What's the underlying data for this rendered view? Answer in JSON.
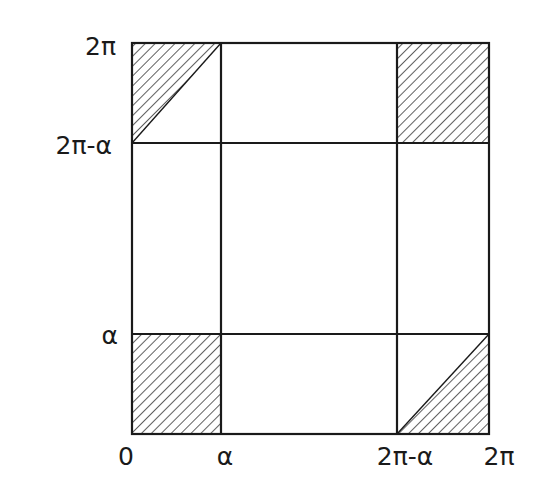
{
  "diagram": {
    "type": "partitioned-square",
    "x_axis": {
      "ticks": [
        "0",
        "α",
        "2π-α",
        "2π"
      ]
    },
    "y_axis": {
      "ticks": [
        "α",
        "2π-α",
        "2π"
      ]
    },
    "shaded_regions": [
      {
        "name": "bottom-left",
        "x": [
          "0",
          "α"
        ],
        "y": [
          "0",
          "α"
        ],
        "shape": "full square"
      },
      {
        "name": "top-right",
        "x": [
          "2π-α",
          "2π"
        ],
        "y": [
          "2π-α",
          "2π"
        ],
        "shape": "full square"
      },
      {
        "name": "top-left",
        "x": [
          "0",
          "α"
        ],
        "y": [
          "2π-α",
          "2π"
        ],
        "shape": "upper-left triangle"
      },
      {
        "name": "bottom-right",
        "x": [
          "2π-α",
          "2π"
        ],
        "y": [
          "0",
          "α"
        ],
        "shape": "lower-right triangle"
      }
    ],
    "colors": {
      "line": "#1a1a1a",
      "background": "#ffffff"
    }
  },
  "labels": {
    "x0": "0",
    "x_alpha": "α",
    "x_2pi_minus_alpha": "2π-α",
    "x_2pi": "2π",
    "y_alpha": "α",
    "y_2pi_minus_alpha": "2π-α",
    "y_2pi": "2π"
  }
}
